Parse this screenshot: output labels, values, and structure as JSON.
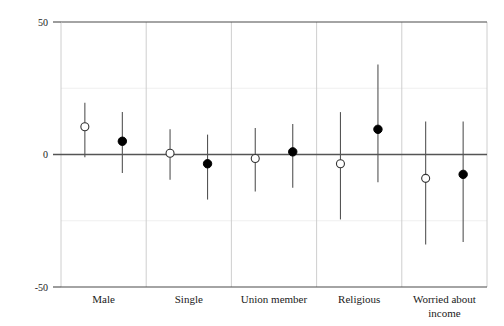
{
  "chart_data": {
    "type": "scatter",
    "title": "",
    "subtitle": "",
    "xlabel": "",
    "ylabel": "",
    "ylim": [
      -50,
      50
    ],
    "yticks": [
      -50,
      0,
      50
    ],
    "ytick_labels": [
      "-50",
      "0",
      "50"
    ],
    "grid": "faint horizontal gridlines at -25 and 25; vertical panel separators between categories",
    "legend": "none",
    "legend_position": "none",
    "categories": [
      "Male",
      "Single",
      "Union member",
      "Religious",
      "Worried about income"
    ],
    "series": [
      {
        "name": "open-circle estimate",
        "marker": "hollow-circle",
        "values": [
          10.5,
          0.5,
          -1.5,
          -3.5,
          -9.0
        ],
        "ci_low": [
          -1.0,
          -9.5,
          -14.0,
          -24.5,
          -34.0
        ],
        "ci_high": [
          19.5,
          9.5,
          10.0,
          16.0,
          12.5
        ]
      },
      {
        "name": "filled-circle estimate",
        "marker": "filled-circle",
        "values": [
          5.0,
          -3.5,
          1.0,
          9.5,
          -7.5
        ],
        "ci_low": [
          -7.0,
          -17.0,
          -12.5,
          -10.5,
          -33.0
        ],
        "ci_high": [
          16.0,
          7.5,
          11.5,
          34.0,
          12.5
        ]
      }
    ],
    "colors": {
      "axis": "#4a4a4a",
      "zero_line": "#555555",
      "whisker": "#555555",
      "open_marker_fill": "#ffffff",
      "open_marker_stroke": "#333333",
      "filled_marker": "#000000",
      "panel_separator": "#c8c8c8",
      "minor_gridline": "#ededed",
      "background": "#ffffff"
    }
  },
  "axis": {
    "y_top_label": "50",
    "y_zero_label": "0",
    "y_bottom_label": "-50"
  },
  "xaxis": {
    "labels": [
      {
        "line1": "Male",
        "line2": ""
      },
      {
        "line1": "Single",
        "line2": ""
      },
      {
        "line1": "Union member",
        "line2": ""
      },
      {
        "line1": "Religious",
        "line2": ""
      },
      {
        "line1": "Worried about",
        "line2": "income"
      }
    ]
  }
}
